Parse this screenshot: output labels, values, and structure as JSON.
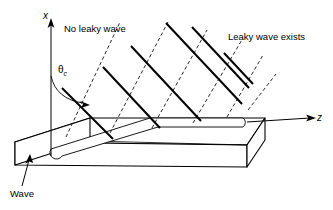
{
  "figure": {
    "background_color": "#ffffff",
    "line_color": "#000000",
    "width": 333,
    "height": 210
  },
  "axes": {
    "x_label": "x",
    "z_label": "z",
    "x_axis_name": "vertical-x-axis",
    "z_axis_name": "horizontal-z-axis"
  },
  "angle": {
    "symbol": "θ",
    "subscript": "c",
    "name": "critical-angle"
  },
  "labels": {
    "no_leaky_wave": "No leaky wave",
    "leaky_wave_exists": "Leaky wave exists",
    "wave": "Wave"
  },
  "rays": {
    "solid_description": "downward-right propagating rays",
    "dashed_description": "upward-right reflected ray paths",
    "solid_count": 6,
    "dashed_count": 6,
    "solid": [
      {
        "x1": 62,
        "y1": 88,
        "x2": 113,
        "y2": 139
      },
      {
        "x1": 103,
        "y1": 67,
        "x2": 160,
        "y2": 128
      },
      {
        "x1": 131,
        "y1": 46,
        "x2": 201,
        "y2": 121
      },
      {
        "x1": 166,
        "y1": 23,
        "x2": 242,
        "y2": 104
      },
      {
        "x1": 192,
        "y1": 27,
        "x2": 249,
        "y2": 88
      },
      {
        "x1": 224,
        "y1": 53,
        "x2": 253,
        "y2": 84
      }
    ],
    "dashed": [
      {
        "x1": 66,
        "y1": 137,
        "x2": 120,
        "y2": 22
      },
      {
        "x1": 110,
        "y1": 133,
        "x2": 168,
        "y2": 22
      },
      {
        "x1": 152,
        "y1": 128,
        "x2": 207,
        "y2": 30
      },
      {
        "x1": 193,
        "y1": 123,
        "x2": 243,
        "y2": 38
      },
      {
        "x1": 227,
        "y1": 117,
        "x2": 263,
        "y2": 55
      },
      {
        "x1": 248,
        "y1": 110,
        "x2": 276,
        "y2": 74
      }
    ]
  },
  "slab": {
    "name": "dielectric-slab-waveguide",
    "top_face": "parallelogram top surface",
    "front_face": "front rectangular face",
    "left_face": "left end face",
    "groove": "elongated rounded stripe on top surface"
  }
}
